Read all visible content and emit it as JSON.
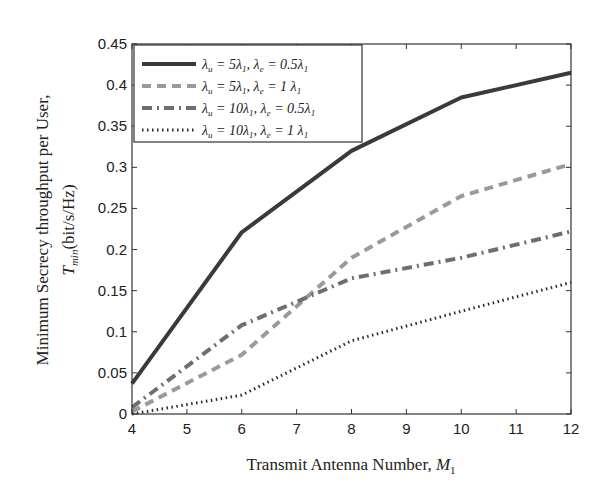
{
  "chart_data": {
    "type": "line",
    "title": "",
    "xlabel": "Transmit Antenna Number, M1",
    "xlabel_main": "Transmit Antenna Number, ",
    "xlabel_symbol": "M",
    "xlabel_sub": "1",
    "ylabel_line1": "Minimum Secrecy throughput per User,",
    "ylabel_line2_symbol": "T",
    "ylabel_line2_sub": "min",
    "ylabel_line2_unit": "(bit/s/Hz)",
    "xlim": [
      4,
      12
    ],
    "ylim": [
      0,
      0.45
    ],
    "x_ticks": [
      4,
      5,
      6,
      7,
      8,
      9,
      10,
      11,
      12
    ],
    "y_ticks": [
      0,
      0.05,
      0.1,
      0.15,
      0.2,
      0.25,
      0.3,
      0.35,
      0.4,
      0.45
    ],
    "y_tick_labels": [
      "0",
      "0.05",
      "0.1",
      "0.15",
      "0.2",
      "0.25",
      "0.3",
      "0.35",
      "0.4",
      "0.45"
    ],
    "grid": false,
    "legend_position": "upper left",
    "x": [
      4,
      6,
      8,
      10,
      12
    ],
    "series": [
      {
        "name": "λu = 5λ1, λe = 0.5λ1",
        "style": "solid",
        "color": "#3a3a3a",
        "width": 4,
        "values": [
          0.037,
          0.221,
          0.32,
          0.385,
          0.415
        ]
      },
      {
        "name": "λu = 5λ1, λe = 1 λ1",
        "style": "dashed",
        "color": "#9a9a9a",
        "width": 4,
        "values": [
          0.003,
          0.072,
          0.19,
          0.265,
          0.304
        ]
      },
      {
        "name": "λu = 10λ1, λe = 0.5λ1",
        "style": "dashdot",
        "color": "#6e6e6e",
        "width": 4,
        "values": [
          0.008,
          0.108,
          0.165,
          0.19,
          0.222
        ]
      },
      {
        "name": "λu = 10λ1, λe = 1 λ1",
        "style": "dotted",
        "color": "#2a2a2a",
        "width": 3,
        "values": [
          0.0,
          0.023,
          0.089,
          0.125,
          0.16
        ]
      }
    ],
    "legend": [
      {
        "label_parts": [
          "λ",
          "u",
          " = 5λ",
          "1",
          ", λ",
          "e",
          " = 0.5λ",
          "1"
        ]
      },
      {
        "label_parts": [
          "λ",
          "u",
          " = 5λ",
          "1",
          ", λ",
          "e",
          " = 1 λ",
          "1"
        ]
      },
      {
        "label_parts": [
          "λ",
          "u",
          " = 10λ",
          "1",
          ", λ",
          "e",
          " = 0.5λ",
          "1"
        ]
      },
      {
        "label_parts": [
          "λ",
          "u",
          " = 10λ",
          "1",
          ", λ",
          "e",
          " = 1 λ",
          "1"
        ]
      }
    ]
  }
}
